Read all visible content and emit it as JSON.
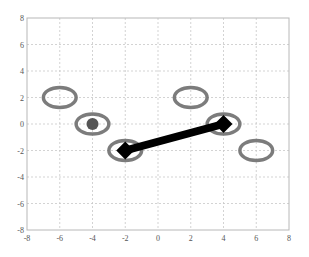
{
  "chart_data": {
    "type": "scatter",
    "title": "",
    "xlabel": "",
    "ylabel": "",
    "xlim": [
      -8,
      8
    ],
    "ylim": [
      -8,
      8
    ],
    "grid": true,
    "x_ticks": [
      "-8",
      "-6",
      "-4",
      "-2",
      "0",
      "2",
      "4",
      "6",
      "8"
    ],
    "y_ticks": [
      "8",
      "6",
      "4",
      "2",
      "0",
      "-2",
      "-4",
      "-6",
      "-8"
    ],
    "ellipses": [
      {
        "cx": -6,
        "cy": 2,
        "rx": 1,
        "ry": 0.8
      },
      {
        "cx": -4,
        "cy": 0,
        "rx": 1,
        "ry": 0.8
      },
      {
        "cx": -2,
        "cy": -2,
        "rx": 1,
        "ry": 0.8
      },
      {
        "cx": 2,
        "cy": 2,
        "rx": 1,
        "ry": 0.8
      },
      {
        "cx": 4,
        "cy": 0,
        "rx": 1,
        "ry": 0.8
      },
      {
        "cx": 6,
        "cy": -2,
        "rx": 1,
        "ry": 0.8
      }
    ],
    "points": [
      {
        "x": -4,
        "y": 0,
        "marker": "filled-circle",
        "color": "#555555"
      }
    ],
    "segments": [
      {
        "from": [
          -2,
          -2
        ],
        "to": [
          4,
          0
        ],
        "marker": "diamond",
        "color": "#000000",
        "linewidth": "thick"
      }
    ],
    "colors": {
      "ellipse": "#6e6e6e",
      "grid": "#c8c8c8",
      "axes": "#b0b0b0",
      "line": "#000000",
      "dot": "#555555"
    }
  }
}
